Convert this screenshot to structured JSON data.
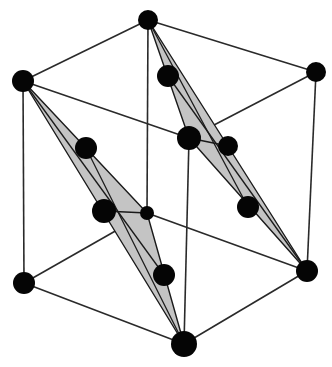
{
  "diagram": {
    "title": "Face-centered cubic unit cell with two shaded close-packed triangular planes",
    "colors": {
      "background": "#ffffff",
      "edge": "#2a2a2a",
      "atom": "#050505",
      "plane_fill": "#c4c4c4",
      "plane_stroke": "#1a1a1a"
    },
    "corner_atoms": [
      {
        "id": "top-back",
        "x": 148,
        "y": 20,
        "r": 10
      },
      {
        "id": "top-left",
        "x": 23,
        "y": 81,
        "r": 11
      },
      {
        "id": "top-right",
        "x": 316,
        "y": 72,
        "r": 10
      },
      {
        "id": "top-front",
        "x": 189,
        "y": 138,
        "r": 12
      },
      {
        "id": "bottom-back",
        "x": 147,
        "y": 213,
        "r": 7
      },
      {
        "id": "bottom-left",
        "x": 24,
        "y": 283,
        "r": 11
      },
      {
        "id": "bottom-right",
        "x": 307,
        "y": 271,
        "r": 11
      },
      {
        "id": "bottom-front",
        "x": 184,
        "y": 344,
        "r": 13
      }
    ],
    "edges": [
      [
        "top-back",
        "top-left"
      ],
      [
        "top-back",
        "top-right"
      ],
      [
        "top-left",
        "top-front"
      ],
      [
        "top-right",
        "top-front"
      ],
      [
        "top-back",
        "bottom-back"
      ],
      [
        "top-left",
        "bottom-left"
      ],
      [
        "top-right",
        "bottom-right"
      ],
      [
        "top-front",
        "bottom-front"
      ],
      [
        "bottom-left",
        "bottom-front"
      ],
      [
        "bottom-right",
        "bottom-front"
      ],
      [
        "bottom-back",
        "bottom-left"
      ],
      [
        "bottom-back",
        "bottom-right"
      ]
    ],
    "planes": [
      {
        "id": "left-plane",
        "vertices": [
          "top-left",
          "bottom-back",
          "bottom-front"
        ],
        "face_atoms": [
          {
            "x": 86,
            "y": 148,
            "r": 11
          },
          {
            "x": 104,
            "y": 211,
            "r": 12
          },
          {
            "x": 164,
            "y": 275,
            "r": 11
          }
        ]
      },
      {
        "id": "right-plane",
        "vertices": [
          "top-back",
          "top-front",
          "bottom-right"
        ],
        "face_atoms": [
          {
            "x": 168,
            "y": 76,
            "r": 11
          },
          {
            "x": 228,
            "y": 146,
            "r": 10
          },
          {
            "x": 248,
            "y": 207,
            "r": 11
          }
        ]
      }
    ]
  }
}
